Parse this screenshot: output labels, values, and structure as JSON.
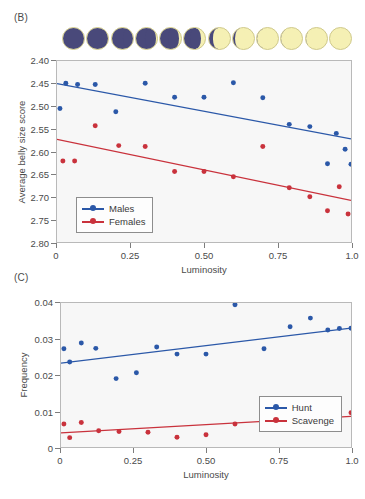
{
  "figure": {
    "panels": [
      {
        "label": "(B)"
      },
      {
        "label": "(C)"
      }
    ]
  },
  "moon_strip": {
    "name": "lunar-phase-sequence",
    "count": 12,
    "description": "new-moon-to-full-moon",
    "dark_color": "#49497a",
    "lit_color": "#f5f0b4",
    "illumination_fractions": [
      0.02,
      0.1,
      0.19,
      0.28,
      0.37,
      0.46,
      0.55,
      0.64,
      0.73,
      0.82,
      0.91,
      1.0
    ]
  },
  "colors": {
    "males": "#2b58a8",
    "females": "#c9323c",
    "hunt": "#2b58a8",
    "scavenge": "#c9323c",
    "plot_background": "#f7f7f7",
    "axis": "#b9b9b9"
  },
  "chart_data": [
    {
      "panel": "(B)",
      "type": "scatter",
      "title": "",
      "xlabel": "Luminosity",
      "ylabel": "Average belly size score",
      "xlim": [
        0,
        1
      ],
      "ylim": [
        2.4,
        2.8
      ],
      "y_inverted": true,
      "grid": false,
      "legend_position": "bottom-left",
      "xticks": [
        0,
        0.25,
        0.5,
        0.75,
        1
      ],
      "xticklabels": [
        "0",
        "0.25",
        "0.50",
        "0.75",
        "1.0"
      ],
      "yticks": [
        2.4,
        2.45,
        2.5,
        2.55,
        2.6,
        2.65,
        2.7,
        2.75,
        2.8
      ],
      "yticklabels": [
        "2.40",
        "2.45",
        "2.50",
        "2.55",
        "2.60",
        "2.65",
        "2.70",
        "2.75",
        "2.80"
      ],
      "series": [
        {
          "name": "Males",
          "color": "#2b58a8",
          "x": [
            0.01,
            0.03,
            0.07,
            0.13,
            0.2,
            0.3,
            0.4,
            0.5,
            0.6,
            0.7,
            0.79,
            0.86,
            0.92,
            0.95,
            0.98,
            1.0
          ],
          "y": [
            2.505,
            2.449,
            2.452,
            2.452,
            2.512,
            2.449,
            2.48,
            2.48,
            2.448,
            2.481,
            2.54,
            2.545,
            2.627,
            2.56,
            2.595,
            2.628
          ],
          "fit_line": {
            "x0": 0.0,
            "y0": 2.45,
            "x1": 1.0,
            "y1": 2.572
          }
        },
        {
          "name": "Females",
          "color": "#c9323c",
          "x": [
            0.02,
            0.06,
            0.13,
            0.21,
            0.3,
            0.4,
            0.5,
            0.6,
            0.7,
            0.79,
            0.86,
            0.92,
            0.96,
            0.99
          ],
          "y": [
            2.621,
            2.621,
            2.543,
            2.587,
            2.589,
            2.644,
            2.644,
            2.656,
            2.589,
            2.68,
            2.7,
            2.731,
            2.678,
            2.738
          ],
          "fit_line": {
            "x0": 0.0,
            "y0": 2.573,
            "x1": 1.0,
            "y1": 2.708
          }
        }
      ]
    },
    {
      "panel": "(C)",
      "type": "scatter",
      "title": "",
      "xlabel": "Luminosity",
      "ylabel": "Frequency",
      "xlim": [
        0,
        1
      ],
      "ylim": [
        0,
        0.04
      ],
      "y_inverted": false,
      "grid": false,
      "legend_position": "bottom-right",
      "xticks": [
        0,
        0.25,
        0.5,
        0.75,
        1
      ],
      "xticklabels": [
        "0",
        "0.25",
        "0.50",
        "0.75",
        "1.0"
      ],
      "yticks": [
        0,
        0.01,
        0.02,
        0.03,
        0.04
      ],
      "yticklabels": [
        "0",
        "0.01",
        "0.02",
        "0.03",
        "0.04"
      ],
      "series": [
        {
          "name": "Hunt",
          "color": "#2b58a8",
          "x": [
            0.01,
            0.03,
            0.07,
            0.12,
            0.19,
            0.26,
            0.33,
            0.4,
            0.5,
            0.6,
            0.7,
            0.79,
            0.86,
            0.92,
            0.96,
            1.0
          ],
          "y": [
            0.0273,
            0.0236,
            0.0289,
            0.0274,
            0.019,
            0.0206,
            0.0278,
            0.0258,
            0.0258,
            0.0395,
            0.0273,
            0.0334,
            0.0358,
            0.0325,
            0.0329,
            0.033
          ],
          "fit_line": {
            "x0": 0.0,
            "y0": 0.0233,
            "x1": 1.0,
            "y1": 0.033
          }
        },
        {
          "name": "Scavenge",
          "color": "#c9323c",
          "x": [
            0.01,
            0.03,
            0.07,
            0.13,
            0.2,
            0.3,
            0.4,
            0.5,
            0.6,
            0.7,
            0.79,
            0.86,
            0.92,
            0.96,
            1.0
          ],
          "y": [
            0.0064,
            0.0026,
            0.0068,
            0.0045,
            0.0043,
            0.0041,
            0.0027,
            0.0034,
            0.0064,
            0.007,
            0.0068,
            0.0098,
            0.0089,
            0.0066,
            0.0095
          ],
          "fit_line": {
            "x0": 0.0,
            "y0": 0.0039,
            "x1": 1.0,
            "y1": 0.0085
          }
        }
      ]
    }
  ]
}
